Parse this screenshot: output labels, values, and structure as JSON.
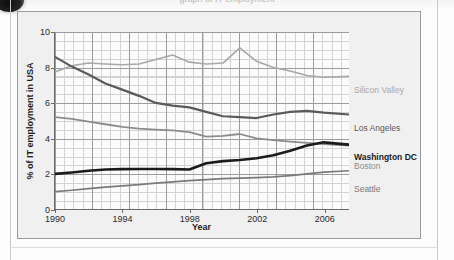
{
  "page": {
    "top_title": "graph  of  IT  employment",
    "badge_icon": "dark-circle-badge"
  },
  "figure": {
    "y_axis_title": "% of IT employment in USA",
    "x_axis_title": "Year",
    "y_ticks": [
      "0",
      "2",
      "4",
      "6",
      "8",
      "10"
    ],
    "x_ticks": [
      "1990",
      "1994",
      "1998",
      "2002",
      "2006"
    ]
  },
  "legend": [
    {
      "label": "Silicon Valley",
      "color": "#a8a8a8",
      "weight": "light",
      "y": 74
    },
    {
      "label": "Los Angeles",
      "color": "#5a5a5a",
      "weight": "mid",
      "y": 112
    },
    {
      "label": "Washington DC",
      "color": "#1b1b1b",
      "weight": "strong",
      "y": 141
    },
    {
      "label": "Boston",
      "color": "#8c8c8c",
      "weight": "light",
      "y": 150
    },
    {
      "label": "Seattle",
      "color": "#7a7a7a",
      "weight": "mid",
      "y": 173
    }
  ],
  "chart_data": {
    "type": "line",
    "title": "",
    "xlabel": "Year",
    "ylabel": "% of IT employment in USA",
    "xlim": [
      1990,
      2007.5
    ],
    "ylim": [
      0,
      10
    ],
    "xticks": [
      1990,
      1994,
      1998,
      2002,
      2006
    ],
    "yticks": [
      0,
      2,
      4,
      6,
      8,
      10
    ],
    "grid": "major-and-minor",
    "legend_position": "right-of-axes",
    "x": [
      1990,
      1991,
      1992,
      1993,
      1994,
      1995,
      1996,
      1997,
      1998,
      1999,
      2000,
      2001,
      2002,
      2003,
      2004,
      2005,
      2006,
      2007.5
    ],
    "series": [
      {
        "name": "Silicon Valley",
        "color": "#a8a8a8",
        "width": 1.6,
        "values": [
          7.75,
          8.1,
          8.25,
          8.2,
          8.15,
          8.2,
          8.45,
          8.7,
          8.3,
          8.2,
          8.25,
          9.1,
          8.35,
          8.0,
          7.8,
          7.55,
          7.45,
          7.5
        ]
      },
      {
        "name": "Los Angeles",
        "color": "#5a5a5a",
        "width": 2.2,
        "values": [
          8.6,
          8.05,
          7.6,
          7.1,
          6.75,
          6.4,
          6.0,
          5.85,
          5.75,
          5.5,
          5.25,
          5.2,
          5.15,
          5.35,
          5.5,
          5.55,
          5.45,
          5.35
        ]
      },
      {
        "name": "Boston",
        "color": "#8c8c8c",
        "width": 1.8,
        "values": [
          5.2,
          5.1,
          4.95,
          4.8,
          4.65,
          4.55,
          4.5,
          4.45,
          4.35,
          4.1,
          4.15,
          4.25,
          4.0,
          3.9,
          3.82,
          3.75,
          3.68,
          3.6
        ]
      },
      {
        "name": "Washington DC",
        "color": "#1b1b1b",
        "width": 2.6,
        "values": [
          2.0,
          2.08,
          2.18,
          2.25,
          2.27,
          2.28,
          2.28,
          2.27,
          2.25,
          2.6,
          2.72,
          2.78,
          2.88,
          3.05,
          3.3,
          3.6,
          3.78,
          3.65
        ]
      },
      {
        "name": "Seattle",
        "color": "#7a7a7a",
        "width": 1.7,
        "values": [
          1.0,
          1.08,
          1.17,
          1.25,
          1.33,
          1.4,
          1.48,
          1.55,
          1.62,
          1.68,
          1.73,
          1.76,
          1.79,
          1.83,
          1.9,
          2.0,
          2.1,
          2.18
        ]
      }
    ]
  }
}
